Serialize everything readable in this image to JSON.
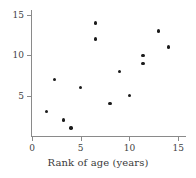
{
  "chart_data": {
    "type": "scatter",
    "title": "",
    "subtitle": "",
    "xlabel": "Rank of age (years)",
    "ylabel": "",
    "xlim": [
      0,
      15.8
    ],
    "ylim": [
      0,
      15.6
    ],
    "xticks": [
      0,
      5,
      10,
      15
    ],
    "xtick_labels": [
      "0",
      "5",
      "10",
      "15"
    ],
    "yticks": [
      5,
      10,
      15
    ],
    "ytick_labels": [
      "5",
      "10",
      "15"
    ],
    "grid": false,
    "legend": null,
    "marker": "filled-circle",
    "marker_color": "#1b1b1b",
    "axis_color": "#8a8a8a",
    "background": "#ffffff",
    "series": [
      {
        "name": "ranks",
        "points": [
          {
            "x": 1.5,
            "y": 3
          },
          {
            "x": 2.3,
            "y": 7
          },
          {
            "x": 3.2,
            "y": 2
          },
          {
            "x": 4.0,
            "y": 1
          },
          {
            "x": 5.0,
            "y": 6
          },
          {
            "x": 6.5,
            "y": 14
          },
          {
            "x": 6.5,
            "y": 12
          },
          {
            "x": 8.0,
            "y": 4
          },
          {
            "x": 9.0,
            "y": 8
          },
          {
            "x": 10.0,
            "y": 5
          },
          {
            "x": 11.4,
            "y": 10
          },
          {
            "x": 11.4,
            "y": 9
          },
          {
            "x": 13.0,
            "y": 13
          },
          {
            "x": 14.0,
            "y": 11
          }
        ]
      }
    ]
  }
}
